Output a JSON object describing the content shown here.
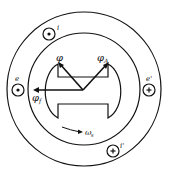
{
  "diagram": {
    "type": "synchronous-machine-cross-section",
    "labels": {
      "phi": "φ",
      "phi_a": "φ",
      "phi_a_sub": "A",
      "phi_f": "φ",
      "phi_f_sub": "f",
      "omega": "ω",
      "omega_sub": "s",
      "cond_i": "i",
      "cond_i_prime": "i'",
      "cond_e": "e",
      "cond_e_prime": "e'"
    },
    "conductors": [
      {
        "name": "i",
        "symbol": "dot"
      },
      {
        "name": "e",
        "symbol": "dot"
      },
      {
        "name": "e'",
        "symbol": "cross"
      },
      {
        "name": "i'",
        "symbol": "cross"
      }
    ],
    "colors": {
      "stroke": "#111111",
      "background": "#ffffff"
    }
  }
}
